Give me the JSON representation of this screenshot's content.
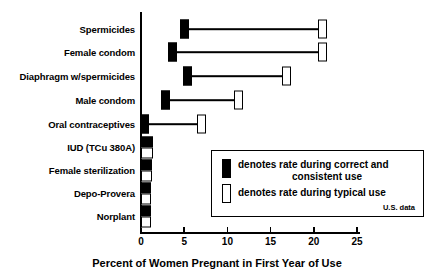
{
  "chart_data": {
    "type": "bar",
    "title": "",
    "xlabel": "Percent of Women Pregnant in First Year of Use",
    "ylabel": "",
    "xlim": [
      0,
      25
    ],
    "xticks": [
      0,
      5,
      10,
      15,
      20,
      25
    ],
    "grid": false,
    "orientation": "horizontal",
    "note": "U.S. data",
    "categories": [
      "Spermicides",
      "Female condom",
      "Diaphragm w/spermicides",
      "Male condom",
      "Oral contraceptives",
      "IUD (TCu 380A)",
      "Female sterilization",
      "Depo-Provera",
      "Norplant"
    ],
    "series": [
      {
        "name": "denotes rate during correct and consistent use",
        "marker": "solid",
        "values": [
          5.0,
          3.7,
          5.4,
          2.8,
          0.4,
          0.6,
          0.5,
          0.4,
          0.4
        ]
      },
      {
        "name": "denotes rate during typical use",
        "marker": "open",
        "values": [
          21.0,
          21.0,
          16.8,
          11.3,
          7.0,
          0.8,
          0.7,
          0.6,
          0.6
        ]
      }
    ],
    "legend": {
      "position": "inside-lower-right",
      "entries": [
        {
          "marker": "solid",
          "label_line1": "denotes rate during correct and",
          "label_line2": "consistent use"
        },
        {
          "marker": "open",
          "label_line1": "denotes rate during typical use",
          "label_line2": ""
        }
      ],
      "note": "U.S. data"
    },
    "colors": {
      "solid": "#000000",
      "open_fill": "#ffffff",
      "stroke": "#000000",
      "background": "#ffffff"
    }
  }
}
